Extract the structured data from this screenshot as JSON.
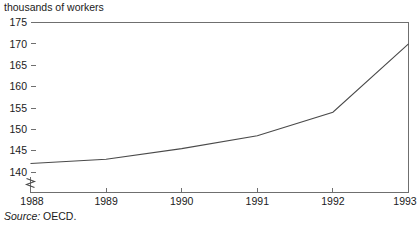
{
  "chart_data": {
    "type": "line",
    "title": "thousands of workers",
    "xlabel": "",
    "ylabel": "",
    "x": [
      1988,
      1989,
      1990,
      1991,
      1992,
      1993
    ],
    "categories": [
      "1988",
      "1989",
      "1990",
      "1991",
      "1992",
      "1993"
    ],
    "values": [
      142.0,
      143.0,
      145.5,
      148.5,
      154.0,
      170.0
    ],
    "series": [
      {
        "name": "workers",
        "values": [
          142.0,
          143.0,
          145.5,
          148.5,
          154.0,
          170.0
        ]
      }
    ],
    "ylim": [
      138.5,
      175
    ],
    "xlim": [
      1988,
      1993
    ],
    "yticks": [
      140,
      145,
      150,
      155,
      160,
      165,
      170,
      175
    ],
    "ytick_labels": [
      "140",
      "145",
      "150",
      "155",
      "160",
      "165",
      "170",
      "175"
    ],
    "xticks": [
      1988,
      1989,
      1990,
      1991,
      1992,
      1993
    ],
    "xtick_labels": [
      "1988",
      "1989",
      "1990",
      "1991",
      "1992",
      "1993"
    ],
    "grid": false,
    "legend": false,
    "axis_break": true,
    "axis_break_axis": "y",
    "line_color": "#4a4a4a",
    "axis_color": "#6f6f6f",
    "background_color": "#ffffff"
  },
  "annotations": {
    "source_label": "Source:",
    "source_value": "OECD."
  },
  "axis_labels": {
    "y": [
      "175",
      "170",
      "165",
      "160",
      "155",
      "150",
      "145",
      "140"
    ],
    "x": [
      "1988",
      "1989",
      "1990",
      "1991",
      "1992",
      "1993"
    ]
  }
}
